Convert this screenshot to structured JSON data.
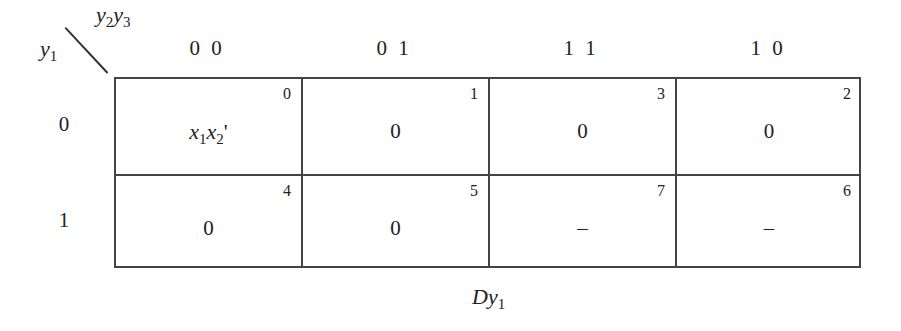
{
  "kmap": {
    "row_var": {
      "base": "y",
      "sub": "1"
    },
    "col_var": {
      "base1": "y",
      "sub1": "2",
      "base2": "y",
      "sub2": "3"
    },
    "col_headers": [
      "0 0",
      "0 1",
      "1 1",
      "1 0"
    ],
    "row_headers": [
      "0",
      "1"
    ],
    "cells": [
      [
        {
          "index": "0",
          "value": "x1x2'",
          "display": {
            "a": "x",
            "as": "1",
            "b": "x",
            "bs": "2",
            "prime": "'"
          }
        },
        {
          "index": "1",
          "value": "0"
        },
        {
          "index": "3",
          "value": "0"
        },
        {
          "index": "2",
          "value": "0"
        }
      ],
      [
        {
          "index": "4",
          "value": "0"
        },
        {
          "index": "5",
          "value": "0"
        },
        {
          "index": "7",
          "value": "–"
        },
        {
          "index": "6",
          "value": "–"
        }
      ]
    ],
    "caption": {
      "base": "Dy",
      "sub": "1"
    }
  }
}
